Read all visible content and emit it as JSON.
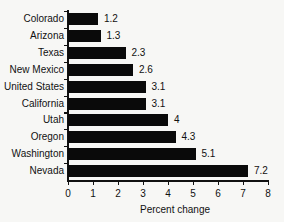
{
  "chart_data": {
    "type": "bar",
    "orientation": "horizontal",
    "title": "",
    "xlabel": "Percent change",
    "ylabel": "",
    "xlim": [
      0,
      8
    ],
    "x_ticks": [
      "0",
      "1",
      "2",
      "3",
      "4",
      "5",
      "6",
      "7",
      "8"
    ],
    "grid": false,
    "legend": null,
    "categories": [
      "Colorado",
      "Arizona",
      "Texas",
      "New Mexico",
      "United States",
      "California",
      "Utah",
      "Oregon",
      "Washington",
      "Nevada"
    ],
    "values": [
      1.2,
      1.3,
      2.3,
      2.6,
      3.1,
      3.1,
      4,
      4.3,
      5.1,
      7.2
    ],
    "value_labels": [
      "1.2",
      "1.3",
      "2.3",
      "2.6",
      "3.1",
      "3.1",
      "4",
      "4.3",
      "5.1",
      "7.2"
    ],
    "bar_color": "#0a0a0a"
  }
}
